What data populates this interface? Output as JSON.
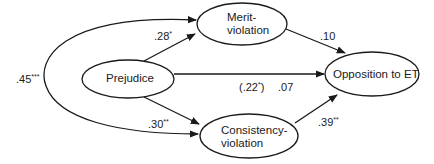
{
  "nodes": {
    "prejudice": {
      "label": "Prejudice"
    },
    "merit": {
      "line1": "Merit-",
      "line2": "violation"
    },
    "consistency": {
      "line1": "Consistency-",
      "line2": "violation"
    },
    "opposition": {
      "label": "Opposition to ET"
    }
  },
  "paths": {
    "prejudice_to_merit": {
      "coef": ".28",
      "sig": "*"
    },
    "prejudice_to_consistency": {
      "coef": ".30",
      "sig": "**"
    },
    "merit_to_opposition": {
      "coef": ".10",
      "sig": ""
    },
    "consistency_to_opposition": {
      "coef": ".39",
      "sig": "**"
    },
    "prejudice_to_opposition_total": {
      "coef": "(.22",
      "sig": "*",
      "close": ")"
    },
    "prejudice_to_opposition_direct": {
      "coef": ".07",
      "sig": ""
    },
    "merit_consistency_correlation": {
      "coef": ".45",
      "sig": "***"
    }
  },
  "colors": {
    "line": "#1a1a1a",
    "background": "#ffffff"
  }
}
